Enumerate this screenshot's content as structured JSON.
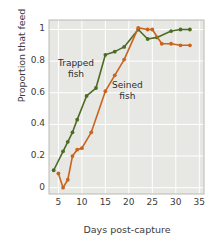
{
  "chart_data": {
    "type": "line",
    "title": "",
    "xlabel": "Days post-capture",
    "ylabel": "Proportion that feed",
    "xlim": [
      3,
      36
    ],
    "ylim": [
      -0.04,
      1.06
    ],
    "xticks": [
      5,
      10,
      15,
      20,
      25,
      30,
      35
    ],
    "yticks": [
      0,
      0.2,
      0.4,
      0.6,
      0.8,
      1
    ],
    "ytick_labels": [
      "0",
      "0.2",
      "0.4",
      "0.6",
      "0.8",
      "1"
    ],
    "xtick_labels": [
      "5",
      "10",
      "15",
      "20",
      "25",
      "30",
      "35"
    ],
    "grid": true,
    "legend": "inline-annotations",
    "plot_background": "#e7e7e4",
    "series": [
      {
        "name": "Trapped fish",
        "color": "#4e6b24",
        "marker": "circle",
        "x": [
          4,
          6,
          7,
          8,
          9,
          11,
          13,
          15,
          17,
          19,
          22,
          24,
          26,
          29,
          31,
          33
        ],
        "y": [
          0.11,
          0.23,
          0.29,
          0.35,
          0.43,
          0.58,
          0.63,
          0.84,
          0.86,
          0.89,
          1.0,
          0.94,
          0.95,
          0.99,
          1.0,
          1.0
        ]
      },
      {
        "name": "Seined fish",
        "color": "#c9641f",
        "marker": "circle",
        "x": [
          5,
          6,
          7,
          8,
          9,
          10,
          12,
          15,
          17,
          19,
          22,
          24,
          25,
          27,
          29,
          31,
          33
        ],
        "y": [
          0.09,
          0.0,
          0.05,
          0.2,
          0.24,
          0.25,
          0.35,
          0.61,
          0.71,
          0.81,
          1.01,
          1.0,
          1.0,
          0.91,
          0.91,
          0.9,
          0.9
        ]
      }
    ],
    "annotations": [
      {
        "text_line1": "Trapped",
        "text_line2": "fish",
        "color": "#2e2e2e",
        "x_px": 58,
        "y_px": 58
      },
      {
        "text_line1": "Seined",
        "text_line2": "fish",
        "color": "#2e2e2e",
        "x_px": 112,
        "y_px": 80
      }
    ]
  }
}
